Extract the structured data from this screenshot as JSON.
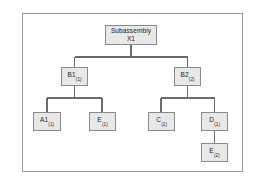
{
  "figure": {
    "type": "tree-diagram",
    "frame": {
      "border_color": "#9a9a9a"
    },
    "style": {
      "node_fill": "#e8e8e8",
      "node_border": "#8a8a8a",
      "connector_color": "#6b6b6b",
      "text_color": "#1a1a1a"
    }
  },
  "nodes": {
    "root": {
      "line1": "Subassembly",
      "line2": "X1",
      "full_label": "Subassembly X1",
      "level": 0
    },
    "b1": {
      "main": "B1",
      "sub": "(1)",
      "full_label": "B1(1)",
      "level": 1
    },
    "b2": {
      "main": "B2",
      "sub": "(2)",
      "full_label": "B2(2)",
      "level": 1
    },
    "a1": {
      "main": "A1",
      "sub": "(1)",
      "full_label": "A1(1)",
      "level": 2
    },
    "e1": {
      "main": "E",
      "sub": "(1)",
      "full_label": "E(1)",
      "level": 2
    },
    "c2": {
      "main": "C",
      "sub": "(2)",
      "full_label": "C(2)",
      "level": 2
    },
    "d1": {
      "main": "D",
      "sub": "(1)",
      "full_label": "D(1)",
      "level": 2
    },
    "e2": {
      "main": "E",
      "sub": "(2)",
      "full_label": "E(2)",
      "level": 3
    }
  },
  "edges": [
    {
      "from": "root",
      "to": "b1"
    },
    {
      "from": "root",
      "to": "b2"
    },
    {
      "from": "b1",
      "to": "a1"
    },
    {
      "from": "b1",
      "to": "e1"
    },
    {
      "from": "b2",
      "to": "c2"
    },
    {
      "from": "b2",
      "to": "d1"
    },
    {
      "from": "d1",
      "to": "e2"
    }
  ]
}
